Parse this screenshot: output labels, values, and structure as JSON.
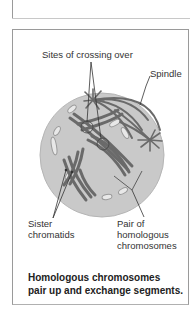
{
  "figure": {
    "labels": {
      "crossing_over": "Sites of crossing over",
      "spindle": "Spindle",
      "sister_chromatids_line1": "Sister",
      "sister_chromatids_line2": "chromatids",
      "homologous_line1": "Pair of",
      "homologous_line2": "homologous",
      "homologous_line3": "chromosomes"
    },
    "caption_line1": "Homologous chromosomes",
    "caption_line2": "pair up and exchange segments.",
    "colors": {
      "cell_fill": "#c9c9c9",
      "chromosome": "#6a6a6a",
      "frame_border": "#9a9a9a"
    }
  }
}
